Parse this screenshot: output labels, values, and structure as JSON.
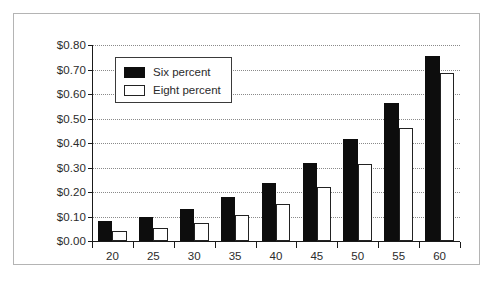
{
  "chart_data": {
    "type": "bar",
    "title": "",
    "subtitle": "",
    "xlabel": "",
    "ylabel": "",
    "categories": [
      "20",
      "25",
      "30",
      "35",
      "40",
      "45",
      "50",
      "55",
      "60"
    ],
    "series": [
      {
        "name": "Six percent",
        "color": "#0d0d0d",
        "fill": "solid-black",
        "values": [
          0.08,
          0.1,
          0.13,
          0.18,
          0.235,
          0.32,
          0.415,
          0.565,
          0.755
        ]
      },
      {
        "name": "Eight percent",
        "color": "#ffffff",
        "fill": "white-outlined",
        "values": [
          0.04,
          0.055,
          0.073,
          0.105,
          0.15,
          0.22,
          0.315,
          0.46,
          0.685
        ]
      }
    ],
    "ylim": [
      0.0,
      0.8
    ],
    "ytick_values": [
      0.0,
      0.1,
      0.2,
      0.3,
      0.4,
      0.5,
      0.6,
      0.7,
      0.8
    ],
    "ytick_labels": [
      "$0.00",
      "$0.10",
      "$0.20",
      "$0.30",
      "$0.40",
      "$0.50",
      "$0.60",
      "$0.70",
      "$0.80"
    ],
    "xtick_labels": [
      "20",
      "25",
      "30",
      "35",
      "40",
      "45",
      "50",
      "55",
      "60"
    ],
    "grid": "horizontal-dotted",
    "legend_position": "top-left-inside",
    "legend_entries": [
      "Six percent",
      "Eight percent"
    ],
    "annotations": []
  },
  "legend": {
    "entries": [
      {
        "label": "Six percent",
        "swatch": "filled-black-square-icon"
      },
      {
        "label": "Eight percent",
        "swatch": "outlined-white-square-icon"
      }
    ]
  },
  "axes": {
    "y": {
      "ticks": [
        {
          "label": "$0.80",
          "value": 0.8
        },
        {
          "label": "$0.70",
          "value": 0.7
        },
        {
          "label": "$0.60",
          "value": 0.6
        },
        {
          "label": "$0.50",
          "value": 0.5
        },
        {
          "label": "$0.40",
          "value": 0.4
        },
        {
          "label": "$0.30",
          "value": 0.3
        },
        {
          "label": "$0.20",
          "value": 0.2
        },
        {
          "label": "$0.10",
          "value": 0.1
        },
        {
          "label": "$0.00",
          "value": 0.0
        }
      ]
    },
    "x": {
      "ticks": [
        {
          "label": "20"
        },
        {
          "label": "25"
        },
        {
          "label": "30"
        },
        {
          "label": "35"
        },
        {
          "label": "40"
        },
        {
          "label": "45"
        },
        {
          "label": "50"
        },
        {
          "label": "55"
        },
        {
          "label": "60"
        }
      ]
    }
  }
}
